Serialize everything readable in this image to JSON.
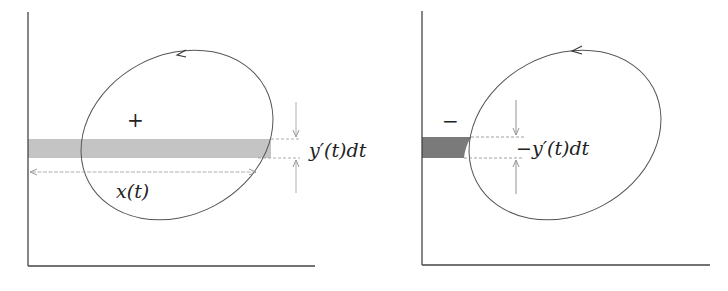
{
  "left_panel": {
    "sign_label": "+",
    "strip_height_label": "y′(t)dt",
    "width_label": "x(t)",
    "strip_color": "#c4c4c4",
    "orientation": "counterclockwise"
  },
  "right_panel": {
    "sign_label": "−",
    "strip_height_label": "−y′(t)dt",
    "strip_color": "#7a7a7a",
    "orientation": "counterclockwise"
  },
  "colors": {
    "curve": "#555555",
    "axis": "#444444",
    "guide": "#999999"
  }
}
